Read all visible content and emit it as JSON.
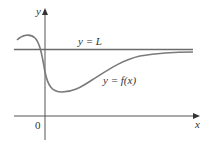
{
  "figure": {
    "axes": {
      "x_label": "x",
      "y_label": "y",
      "origin_label": "0"
    },
    "lines": {
      "asymptote_label": "y = L",
      "function_label": "y = f(x)"
    },
    "colors": {
      "axis": "#555555",
      "asymptote": "#6b6b6b",
      "curve": "#7a7a7a",
      "text": "#333333"
    }
  }
}
